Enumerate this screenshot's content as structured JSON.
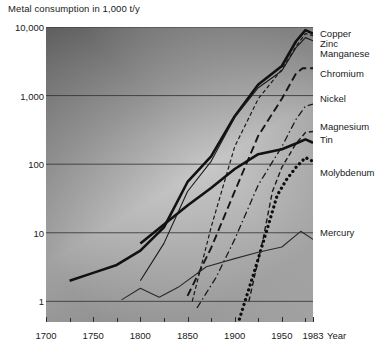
{
  "chart_data": {
    "type": "line",
    "title": "Metal consumption in 1,000 t/y",
    "xlabel": "Year",
    "ylabel": "",
    "yscale": "log",
    "ylim": [
      0.5,
      10000
    ],
    "xlim": [
      1700,
      1983
    ],
    "grid": true,
    "legend_position": "right-inline",
    "ytick_labels": [
      "10,000",
      "1,000",
      "100",
      "10",
      "1"
    ],
    "ytick_values": [
      10000,
      1000,
      100,
      10,
      1
    ],
    "xtick_labels": [
      "1700",
      "1750",
      "1800",
      "1850",
      "1900",
      "1950",
      "1983"
    ],
    "xtick_values": [
      1700,
      1750,
      1800,
      1850,
      1900,
      1950,
      1983
    ],
    "minor_xticks": [
      1725,
      1775,
      1825,
      1875,
      1925,
      1975
    ],
    "series": [
      {
        "name": "Copper",
        "style": "solid-thick",
        "color": "#111111",
        "label_y": 33,
        "points": [
          [
            1725,
            2.0
          ],
          [
            1750,
            2.6
          ],
          [
            1775,
            3.4
          ],
          [
            1800,
            5.5
          ],
          [
            1825,
            12
          ],
          [
            1850,
            55
          ],
          [
            1875,
            130
          ],
          [
            1900,
            500
          ],
          [
            1925,
            1450
          ],
          [
            1950,
            2700
          ],
          [
            1965,
            6200
          ],
          [
            1975,
            9000
          ],
          [
            1983,
            8000
          ]
        ]
      },
      {
        "name": "Zinc",
        "style": "solid-thin",
        "color": "#1a1a1a",
        "label_y": 43,
        "points": [
          [
            1800,
            2.0
          ],
          [
            1825,
            7.0
          ],
          [
            1850,
            40
          ],
          [
            1875,
            110
          ],
          [
            1900,
            480
          ],
          [
            1925,
            1300
          ],
          [
            1950,
            2300
          ],
          [
            1965,
            5000
          ],
          [
            1975,
            7000
          ],
          [
            1983,
            6300
          ]
        ]
      },
      {
        "name": "Manganese",
        "style": "dashed-fine",
        "color": "#1a1a1a",
        "label_y": 53,
        "points": [
          [
            1855,
            1.0
          ],
          [
            1875,
            12
          ],
          [
            1900,
            180
          ],
          [
            1925,
            900
          ],
          [
            1950,
            2400
          ],
          [
            1965,
            5200
          ],
          [
            1975,
            8000
          ],
          [
            1983,
            7500
          ]
        ]
      },
      {
        "name": "Chromium",
        "style": "dashed-long",
        "color": "#151515",
        "label_y": 73,
        "points": [
          [
            1850,
            1.2
          ],
          [
            1875,
            6
          ],
          [
            1900,
            40
          ],
          [
            1925,
            260
          ],
          [
            1950,
            900
          ],
          [
            1965,
            2100
          ],
          [
            1972,
            2500
          ],
          [
            1983,
            2500
          ]
        ]
      },
      {
        "name": "Nickel",
        "style": "dash-dot",
        "color": "#1a1a1a",
        "label_y": 98,
        "points": [
          [
            1860,
            0.8
          ],
          [
            1880,
            2.2
          ],
          [
            1900,
            8
          ],
          [
            1925,
            50
          ],
          [
            1950,
            180
          ],
          [
            1965,
            450
          ],
          [
            1975,
            700
          ],
          [
            1983,
            750
          ]
        ]
      },
      {
        "name": "Magnesium",
        "style": "dashed-med",
        "color": "#1a1a1a",
        "label_y": 126,
        "points": [
          [
            1915,
            1.0
          ],
          [
            1930,
            8
          ],
          [
            1940,
            40
          ],
          [
            1950,
            90
          ],
          [
            1965,
            200
          ],
          [
            1975,
            290
          ],
          [
            1983,
            300
          ]
        ]
      },
      {
        "name": "Tin",
        "style": "solid-thick",
        "color": "#111111",
        "label_y": 139,
        "points": [
          [
            1800,
            7.0
          ],
          [
            1850,
            25
          ],
          [
            1875,
            45
          ],
          [
            1900,
            85
          ],
          [
            1925,
            140
          ],
          [
            1950,
            165
          ],
          [
            1965,
            200
          ],
          [
            1975,
            230
          ],
          [
            1983,
            205
          ]
        ]
      },
      {
        "name": "Molybdenum",
        "style": "dotted-thick",
        "color": "#0d0d0d",
        "label_y": 172,
        "points": [
          [
            1905,
            0.55
          ],
          [
            1920,
            2.5
          ],
          [
            1935,
            12
          ],
          [
            1945,
            35
          ],
          [
            1955,
            60
          ],
          [
            1965,
            90
          ],
          [
            1975,
            125
          ],
          [
            1983,
            110
          ]
        ]
      },
      {
        "name": "Mercury",
        "style": "solid-thin",
        "color": "#2a2a2a",
        "label_y": 232,
        "points": [
          [
            1780,
            1.05
          ],
          [
            1800,
            1.55
          ],
          [
            1820,
            1.15
          ],
          [
            1840,
            1.6
          ],
          [
            1870,
            3.2
          ],
          [
            1900,
            4.2
          ],
          [
            1925,
            5.2
          ],
          [
            1950,
            6.2
          ],
          [
            1970,
            10.5
          ],
          [
            1983,
            8.0
          ]
        ]
      }
    ]
  }
}
